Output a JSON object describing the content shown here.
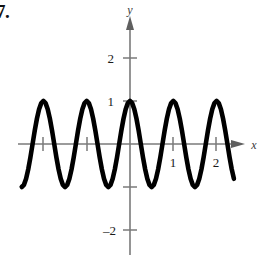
{
  "problem": {
    "number": "7."
  },
  "figure": {
    "axis_labels": {
      "x": "x",
      "y": "y"
    },
    "y_tick_labels": {
      "two": "2",
      "one": "1",
      "neg_two": "–2"
    },
    "x_tick_labels": {
      "one": "1",
      "two": "2"
    },
    "colors": {
      "curve": "#000000",
      "axis": "#7a7a7a",
      "text": "#1a1a1a"
    }
  },
  "chart_data": {
    "type": "line",
    "title": "",
    "subtitle": "",
    "xlabel": "x",
    "ylabel": "y",
    "xlim": [
      -2.55,
      2.45
    ],
    "ylim": [
      -2.6,
      2.5
    ],
    "grid": false,
    "legend": null,
    "annotations": [],
    "x_ticks": [
      -2,
      -1,
      1,
      2
    ],
    "x_tick_labels": [
      "",
      "",
      "1",
      "2"
    ],
    "y_ticks": [
      -2,
      -1,
      1,
      2
    ],
    "y_tick_labels": [
      "–2",
      "",
      "1",
      "2"
    ],
    "function": "y = cos(2*pi*x)",
    "amplitude": 1,
    "period": 1,
    "series": [
      {
        "name": "y = cos(2πx)",
        "x": [
          -2.5,
          -2.45,
          -2.4,
          -2.35,
          -2.3,
          -2.25,
          -2.2,
          -2.15,
          -2.1,
          -2.05,
          -2.0,
          -1.95,
          -1.9,
          -1.85,
          -1.8,
          -1.75,
          -1.7,
          -1.65,
          -1.6,
          -1.55,
          -1.5,
          -1.45,
          -1.4,
          -1.35,
          -1.3,
          -1.25,
          -1.2,
          -1.15,
          -1.1,
          -1.05,
          -1.0,
          -0.95,
          -0.9,
          -0.85,
          -0.8,
          -0.75,
          -0.7,
          -0.65,
          -0.6,
          -0.55,
          -0.5,
          -0.45,
          -0.4,
          -0.35,
          -0.3,
          -0.25,
          -0.2,
          -0.15,
          -0.1,
          -0.05,
          0.0,
          0.05,
          0.1,
          0.15,
          0.2,
          0.25,
          0.3,
          0.35,
          0.4,
          0.45,
          0.5,
          0.55,
          0.6,
          0.65,
          0.7,
          0.75,
          0.8,
          0.85,
          0.9,
          0.95,
          1.0,
          1.05,
          1.1,
          1.15,
          1.2,
          1.25,
          1.3,
          1.35,
          1.4,
          1.45,
          1.5,
          1.55,
          1.6,
          1.65,
          1.7,
          1.75,
          1.8,
          1.85,
          1.9,
          1.95,
          2.0,
          2.05,
          2.1,
          2.15,
          2.2,
          2.25,
          2.3,
          2.35,
          2.4
        ],
        "y": [
          -1.0,
          -0.951,
          -0.809,
          -0.588,
          -0.309,
          0.0,
          0.309,
          0.588,
          0.809,
          0.951,
          1.0,
          0.951,
          0.809,
          0.588,
          0.309,
          0.0,
          -0.309,
          -0.588,
          -0.809,
          -0.951,
          -1.0,
          -0.951,
          -0.809,
          -0.588,
          -0.309,
          0.0,
          0.309,
          0.588,
          0.809,
          0.951,
          1.0,
          0.951,
          0.809,
          0.588,
          0.309,
          0.0,
          -0.309,
          -0.588,
          -0.809,
          -0.951,
          -1.0,
          -0.951,
          -0.809,
          -0.588,
          -0.309,
          0.0,
          0.309,
          0.588,
          0.809,
          0.951,
          1.0,
          0.951,
          0.809,
          0.588,
          0.309,
          0.0,
          -0.309,
          -0.588,
          -0.809,
          -0.951,
          -1.0,
          -0.951,
          -0.809,
          -0.588,
          -0.309,
          0.0,
          0.309,
          0.588,
          0.809,
          0.951,
          1.0,
          0.951,
          0.809,
          0.588,
          0.309,
          0.0,
          -0.309,
          -0.588,
          -0.809,
          -0.951,
          -1.0,
          -0.951,
          -0.809,
          -0.588,
          -0.309,
          0.0,
          0.309,
          0.588,
          0.809,
          0.951,
          1.0,
          0.951,
          0.809,
          0.588,
          0.309,
          0.0,
          -0.309,
          -0.588,
          -0.809
        ]
      }
    ]
  }
}
